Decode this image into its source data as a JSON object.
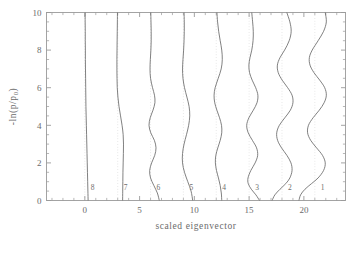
{
  "figure": {
    "background": "#ffffff",
    "axis_color": "#9a9a9a",
    "curve_color": "#6a6a6a",
    "grid_color": "#c9c9c9"
  },
  "chart_data": {
    "type": "line",
    "title": "",
    "xlabel": "scaled eigenvector",
    "ylabel": "-ln(p/p_0)",
    "ylabel_parts": {
      "prefix": "-ln(p/p",
      "sub": "0",
      "suffix": ")"
    },
    "xlim": [
      -3.5,
      23.8
    ],
    "ylim": [
      0,
      10
    ],
    "xticks": [
      0,
      5,
      10,
      15,
      20
    ],
    "xtick_labels": [
      "0",
      "5",
      "10",
      "15",
      "20"
    ],
    "xminor_step": 1,
    "yticks": [
      0,
      2,
      4,
      6,
      8,
      10
    ],
    "ytick_labels": [
      "0",
      "2",
      "4",
      "6",
      "8",
      "10"
    ],
    "yminor_step": 0.5,
    "grid": "vertical dotted reference lines at each curve offset",
    "legend": "none (curves labelled inline near y=0.5)",
    "annotations": [
      {
        "text": "8",
        "x": 0.55,
        "y": 0.55
      },
      {
        "text": "7",
        "x": 3.55,
        "y": 0.55
      },
      {
        "text": "6",
        "x": 6.55,
        "y": 0.55
      },
      {
        "text": "5",
        "x": 9.55,
        "y": 0.55
      },
      {
        "text": "4",
        "x": 12.55,
        "y": 0.55
      },
      {
        "text": "3",
        "x": 15.55,
        "y": 0.55
      },
      {
        "text": "2",
        "x": 18.55,
        "y": 0.55
      },
      {
        "text": "1",
        "x": 21.55,
        "y": 0.55
      }
    ],
    "gridlines_x": [
      0,
      3,
      6,
      9,
      12,
      15,
      18,
      21
    ],
    "series": [
      {
        "name": "8",
        "offset": 0,
        "nodes": 0,
        "points_y": [
          0,
          0.5,
          1,
          1.5,
          2,
          2.5,
          3,
          3.5,
          4,
          4.5,
          5,
          5.5,
          6,
          6.5,
          7,
          7.5,
          8,
          8.5,
          9,
          9.5,
          10
        ],
        "points_x": [
          0.3,
          0.28,
          0.26,
          0.24,
          0.22,
          0.2,
          0.18,
          0.16,
          0.14,
          0.12,
          0.1,
          0.09,
          0.08,
          0.07,
          0.06,
          0.05,
          0.05,
          0.04,
          0.04,
          0.03,
          0.03
        ]
      },
      {
        "name": "7",
        "offset": 3,
        "nodes": 1,
        "points_y": [
          0,
          0.5,
          1,
          1.5,
          2,
          2.5,
          3,
          3.5,
          4,
          4.5,
          5,
          5.5,
          6,
          6.5,
          7,
          7.5,
          8,
          8.5,
          9,
          9.5,
          10
        ],
        "points_x": [
          3.45,
          3.46,
          3.47,
          3.48,
          3.5,
          3.52,
          3.53,
          3.5,
          3.4,
          3.26,
          3.12,
          3.02,
          2.96,
          2.94,
          2.93,
          2.93,
          2.94,
          2.95,
          2.96,
          2.97,
          2.98
        ]
      },
      {
        "name": "6",
        "offset": 6,
        "nodes": 3,
        "points_y": [
          0,
          0.4,
          0.8,
          1.2,
          1.6,
          2.0,
          2.4,
          2.8,
          3.2,
          3.6,
          4.0,
          4.4,
          4.8,
          5.2,
          5.6,
          6.0,
          6.5,
          7.0,
          7.5,
          8.0,
          8.5,
          9.0,
          9.5,
          10
        ],
        "points_x": [
          6.8,
          6.62,
          6.3,
          6.0,
          5.92,
          6.1,
          6.38,
          6.5,
          6.35,
          6.02,
          5.86,
          5.97,
          6.22,
          6.4,
          6.36,
          6.18,
          6.0,
          5.95,
          5.98,
          6.03,
          6.06,
          6.06,
          6.04,
          6.02
        ]
      },
      {
        "name": "5",
        "offset": 9,
        "nodes": 2,
        "points_y": [
          0,
          0.5,
          1,
          1.5,
          2,
          2.5,
          3,
          3.5,
          4,
          4.5,
          5,
          5.5,
          6,
          6.5,
          7,
          7.5,
          8,
          8.5,
          9,
          9.5,
          10
        ],
        "points_x": [
          9.85,
          9.7,
          9.4,
          9.1,
          8.92,
          8.92,
          9.06,
          9.28,
          9.48,
          9.58,
          9.52,
          9.32,
          9.1,
          8.96,
          8.92,
          8.96,
          9.02,
          9.06,
          9.08,
          9.08,
          9.06
        ]
      },
      {
        "name": "4",
        "offset": 12,
        "nodes": 3,
        "points_y": [
          0,
          0.4,
          0.8,
          1.2,
          1.6,
          2.0,
          2.4,
          2.8,
          3.2,
          3.6,
          4.0,
          4.4,
          4.8,
          5.2,
          5.6,
          6.0,
          6.5,
          7.0,
          7.5,
          8.0,
          8.5,
          9.0,
          9.5,
          10
        ],
        "points_x": [
          12.5,
          12.46,
          12.36,
          12.2,
          12.02,
          11.92,
          11.96,
          12.14,
          12.36,
          12.5,
          12.48,
          12.3,
          12.06,
          11.86,
          11.8,
          11.9,
          12.18,
          12.45,
          12.55,
          12.5,
          12.36,
          12.22,
          12.12,
          12.06
        ]
      },
      {
        "name": "3",
        "offset": 15,
        "nodes": 5,
        "points_y": [
          0,
          0.3,
          0.6,
          0.9,
          1.2,
          1.6,
          2.0,
          2.4,
          2.8,
          3.2,
          3.6,
          4.0,
          4.4,
          4.8,
          5.2,
          5.6,
          6.0,
          6.4,
          6.8,
          7.2,
          7.6,
          8.0,
          8.5,
          9.0,
          9.5,
          10
        ],
        "points_x": [
          15.95,
          15.62,
          15.2,
          14.92,
          14.9,
          15.16,
          15.55,
          15.78,
          15.68,
          15.3,
          14.92,
          14.78,
          14.98,
          15.38,
          15.72,
          15.8,
          15.6,
          15.28,
          15.04,
          14.98,
          15.08,
          15.24,
          15.36,
          15.38,
          15.32,
          15.24
        ]
      },
      {
        "name": "2",
        "offset": 18,
        "nodes": 5,
        "points_y": [
          0,
          0.3,
          0.6,
          0.9,
          1.2,
          1.6,
          2.0,
          2.4,
          2.8,
          3.2,
          3.6,
          4.0,
          4.4,
          4.8,
          5.2,
          5.6,
          6.0,
          6.4,
          6.8,
          7.2,
          7.6,
          8.0,
          8.5,
          9.0,
          9.5,
          10
        ],
        "points_x": [
          17.1,
          17.35,
          17.82,
          18.35,
          18.72,
          18.92,
          18.82,
          18.45,
          17.96,
          17.6,
          17.52,
          17.76,
          18.26,
          18.76,
          19.0,
          18.92,
          18.52,
          18.02,
          17.66,
          17.58,
          17.82,
          18.24,
          18.66,
          18.84,
          18.72,
          18.44
        ]
      },
      {
        "name": "1",
        "offset": 21,
        "nodes": 4,
        "points_y": [
          0,
          0.3,
          0.6,
          0.9,
          1.2,
          1.6,
          2.0,
          2.4,
          2.8,
          3.2,
          3.6,
          4.0,
          4.4,
          4.8,
          5.2,
          5.6,
          6.0,
          6.4,
          6.8,
          7.2,
          7.6,
          8.0,
          8.5,
          9.0,
          9.5,
          10
        ],
        "points_x": [
          19.55,
          19.7,
          20.1,
          20.7,
          21.3,
          21.8,
          21.95,
          21.7,
          21.16,
          20.62,
          20.34,
          20.42,
          20.84,
          21.4,
          21.85,
          22.05,
          21.9,
          21.45,
          20.92,
          20.56,
          20.5,
          20.76,
          21.3,
          21.8,
          22.05,
          21.95
        ]
      }
    ]
  }
}
